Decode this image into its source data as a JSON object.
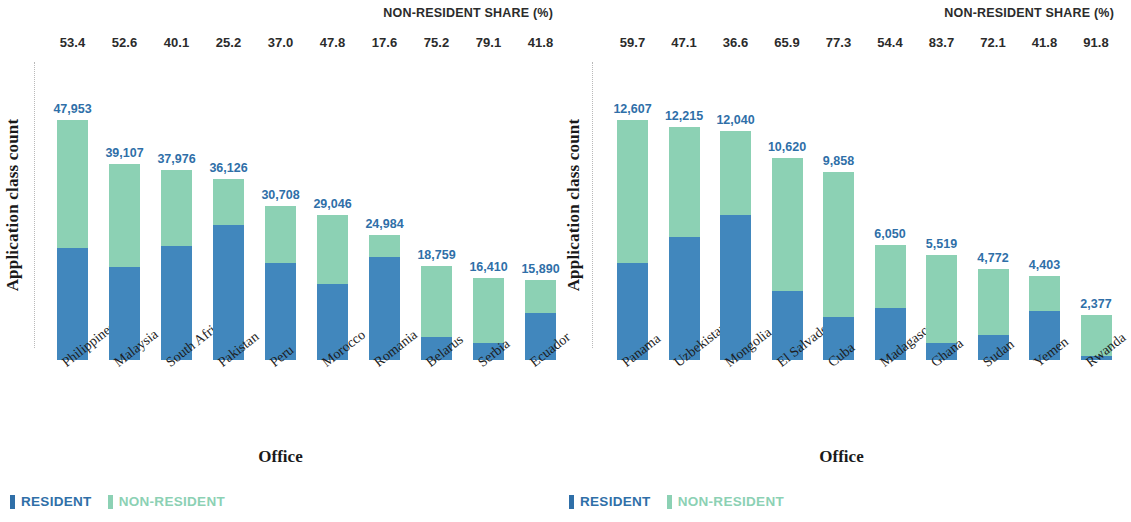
{
  "colors": {
    "resident": "#4187bd",
    "non_resident": "#8cd1b4",
    "value_label": "#2f6fa8",
    "legend_resident_text": "#2f6fa8",
    "legend_non_resident_text": "#8cd1b4",
    "header_text": "#2b2b2b"
  },
  "panels": [
    {
      "id": "left",
      "share_header": "NON-RESIDENT SHARE (%)",
      "y_axis_title": "Application class count",
      "x_axis_title": "Office",
      "legend": {
        "resident": "RESIDENT",
        "non_resident": "NON-RESIDENT"
      }
    },
    {
      "id": "right",
      "share_header": "NON-RESIDENT SHARE (%)",
      "y_axis_title": "Application class count",
      "x_axis_title": "Office",
      "legend": {
        "resident": "RESIDENT",
        "non_resident": "NON-RESIDENT"
      }
    }
  ],
  "chart_data": [
    {
      "type": "bar",
      "subtype": "stacked-bar",
      "panel": "left",
      "title": "",
      "xlabel": "Office",
      "ylabel": "Application class count",
      "grid": false,
      "legend_position": "bottom-left",
      "ylim": [
        0,
        47953
      ],
      "categories": [
        "Philippines",
        "Malaysia",
        "South Africa",
        "Pakistan",
        "Peru",
        "Morocco",
        "Romania",
        "Belarus",
        "Serbia",
        "Ecuador"
      ],
      "totals": [
        47953,
        39107,
        37976,
        36126,
        30708,
        29046,
        24984,
        18759,
        16410,
        15890
      ],
      "total_labels": [
        "47,953",
        "39,107",
        "37,976",
        "36,126",
        "30,708",
        "29,046",
        "24,984",
        "18,759",
        "16,410",
        "15,890"
      ],
      "non_resident_share_pct": [
        53.4,
        52.6,
        40.1,
        25.2,
        37.0,
        47.8,
        17.6,
        75.2,
        79.1,
        41.8
      ],
      "non_resident_share_labels": [
        "53.4",
        "52.6",
        "40.1",
        "25.2",
        "37.0",
        "47.8",
        "17.6",
        "75.2",
        "79.1",
        "41.8"
      ],
      "series": [
        {
          "name": "RESIDENT",
          "color": "#4187bd",
          "values": [
            22346,
            18537,
            22748,
            27022,
            19346,
            15162,
            20587,
            4652,
            3430,
            9248
          ]
        },
        {
          "name": "NON-RESIDENT",
          "color": "#8cd1b4",
          "values": [
            25607,
            20570,
            15228,
            9104,
            11362,
            13884,
            4397,
            14107,
            12980,
            6642
          ]
        }
      ]
    },
    {
      "type": "bar",
      "subtype": "stacked-bar",
      "panel": "right",
      "title": "",
      "xlabel": "Office",
      "ylabel": "Application class count",
      "grid": false,
      "legend_position": "bottom-left",
      "ylim": [
        0,
        12607
      ],
      "categories": [
        "Panama",
        "Uzbekistan",
        "Mongolia",
        "El Salvador",
        "Cuba",
        "Madagascar",
        "Ghana",
        "Sudan",
        "Yemen",
        "Rwanda"
      ],
      "totals": [
        12607,
        12215,
        12040,
        10620,
        9858,
        6050,
        5519,
        4772,
        4403,
        2377
      ],
      "total_labels": [
        "12,607",
        "12,215",
        "12,040",
        "10,620",
        "9,858",
        "6,050",
        "5,519",
        "4,772",
        "4,403",
        "2,377"
      ],
      "non_resident_share_pct": [
        59.7,
        47.1,
        36.6,
        65.9,
        77.3,
        54.4,
        83.7,
        72.1,
        41.8,
        91.8
      ],
      "non_resident_share_labels": [
        "59.7",
        "47.1",
        "36.6",
        "65.9",
        "77.3",
        "54.4",
        "83.7",
        "72.1",
        "41.8",
        "91.8"
      ],
      "series": [
        {
          "name": "RESIDENT",
          "color": "#4187bd",
          "values": [
            5081,
            6462,
            7633,
            3621,
            2238,
            2759,
            899,
            1331,
            2563,
            195
          ]
        },
        {
          "name": "NON-RESIDENT",
          "color": "#8cd1b4",
          "values": [
            7526,
            5753,
            4407,
            6999,
            7620,
            3291,
            4620,
            3441,
            1840,
            2182
          ]
        }
      ]
    }
  ]
}
